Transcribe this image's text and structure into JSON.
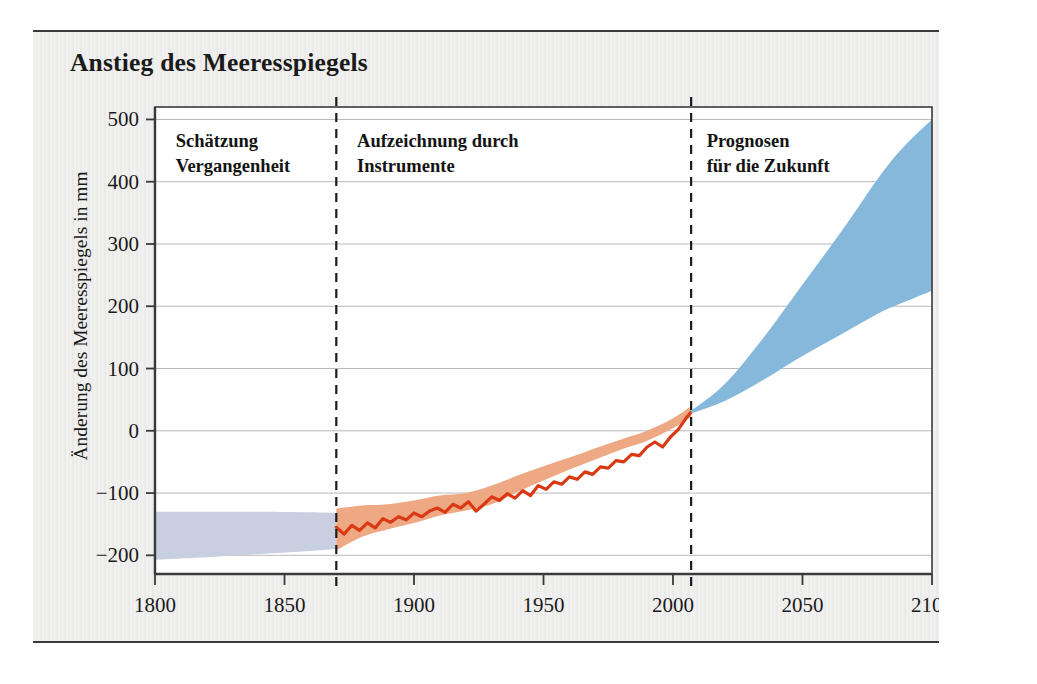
{
  "figure": {
    "title": "Anstieg des Meeresspiegels",
    "source_note": "Quelle: Intergovernmental Panel on Climate Change (IPCC)",
    "background_color": "#f3f2f0",
    "frame_rule_color": "#3a3a38"
  },
  "chart_data": {
    "type": "area",
    "title": "Anstieg des Meeresspiegels",
    "xlabel": "",
    "ylabel": "Änderung des Meeresspiegels in mm",
    "xlim": [
      1800,
      2100
    ],
    "ylim": [
      -230,
      520
    ],
    "xticks": [
      1800,
      1850,
      1900,
      1950,
      2000,
      2050,
      2100
    ],
    "yticks": [
      -200,
      -100,
      0,
      100,
      200,
      300,
      400,
      500
    ],
    "xtick_labels": [
      "1800",
      "1850",
      "1900",
      "1950",
      "2000",
      "2050",
      "2100"
    ],
    "ytick_labels": [
      "500",
      "400",
      "300",
      "200",
      "100",
      "0",
      "−100",
      "−200"
    ],
    "grid": true,
    "grid_color": "#b9b9b9",
    "legend": "none",
    "annotations": [
      {
        "id": "past-estimate",
        "text_line1": "Schätzung",
        "text_line2": "Vergangenheit",
        "x": 1808,
        "y": 455
      },
      {
        "id": "instrumental-record",
        "text_line1": "Aufzeichnung durch",
        "text_line2": "Instrumente",
        "x": 1878,
        "y": 455
      },
      {
        "id": "future-projection",
        "text_line1": "Prognosen",
        "text_line2": "für die Zukunft",
        "x": 2013,
        "y": 455
      }
    ],
    "dividers": [
      {
        "id": "divider-1870",
        "x": 1870,
        "style": "dashed",
        "color": "#1c1c1c"
      },
      {
        "id": "divider-2007",
        "x": 2007,
        "style": "dashed",
        "color": "#1c1c1c"
      }
    ],
    "series": [
      {
        "name": "Schätzung Vergangenheit (Proxy-Band)",
        "id": "proxy-band",
        "type": "band",
        "color": "#c8cfe0",
        "x": [
          1800,
          1820,
          1840,
          1860,
          1870
        ],
        "upper": [
          -130,
          -130,
          -130,
          -131,
          -132
        ],
        "lower": [
          -207,
          -203,
          -198,
          -193,
          -190
        ]
      },
      {
        "name": "Aufzeichnung durch Instrumente (Unsicherheitsband)",
        "id": "instrumental-band",
        "type": "band",
        "color": "#efa884",
        "x": [
          1870,
          1880,
          1890,
          1900,
          1910,
          1920,
          1930,
          1940,
          1950,
          1960,
          1970,
          1980,
          1990,
          2000,
          2007
        ],
        "upper": [
          -125,
          -120,
          -118,
          -112,
          -104,
          -100,
          -88,
          -72,
          -57,
          -43,
          -28,
          -14,
          0,
          20,
          40
        ],
        "lower": [
          -192,
          -170,
          -158,
          -148,
          -136,
          -128,
          -118,
          -98,
          -80,
          -62,
          -46,
          -30,
          -16,
          4,
          22
        ]
      },
      {
        "name": "Gemessener Meeresspiegel",
        "id": "instrumental-line",
        "type": "line",
        "color": "#d93a14",
        "width": 3.2,
        "x": [
          1870,
          1873,
          1876,
          1879,
          1882,
          1885,
          1888,
          1891,
          1894,
          1897,
          1900,
          1903,
          1906,
          1909,
          1912,
          1915,
          1918,
          1921,
          1924,
          1927,
          1930,
          1933,
          1936,
          1939,
          1942,
          1945,
          1948,
          1951,
          1954,
          1957,
          1960,
          1963,
          1966,
          1969,
          1972,
          1975,
          1978,
          1981,
          1984,
          1987,
          1990,
          1993,
          1996,
          1999,
          2002,
          2005,
          2007
        ],
        "y": [
          -155,
          -166,
          -152,
          -160,
          -148,
          -156,
          -141,
          -147,
          -138,
          -143,
          -132,
          -138,
          -129,
          -124,
          -131,
          -118,
          -124,
          -114,
          -129,
          -118,
          -106,
          -112,
          -101,
          -108,
          -96,
          -104,
          -88,
          -94,
          -82,
          -86,
          -74,
          -78,
          -66,
          -70,
          -58,
          -60,
          -48,
          -50,
          -38,
          -40,
          -26,
          -18,
          -26,
          -10,
          2,
          20,
          30
        ]
      },
      {
        "name": "Prognosen für die Zukunft (Projektionsbereich)",
        "id": "projection-cone",
        "type": "band",
        "color": "#85b8db",
        "x": [
          2007,
          2020,
          2035,
          2050,
          2065,
          2080,
          2090,
          2100
        ],
        "upper": [
          32,
          75,
          150,
          235,
          320,
          410,
          460,
          500
        ],
        "lower": [
          28,
          48,
          82,
          120,
          155,
          190,
          208,
          225
        ]
      }
    ]
  },
  "axes": {
    "y_axis_title": "Änderung des Meeresspiegels in mm",
    "ytick_labels": [
      "500",
      "400",
      "300",
      "200",
      "100",
      "0",
      "−100",
      "−200"
    ],
    "xtick_labels": [
      "1800",
      "1850",
      "1900",
      "1950",
      "2000",
      "2050",
      "2100"
    ]
  }
}
